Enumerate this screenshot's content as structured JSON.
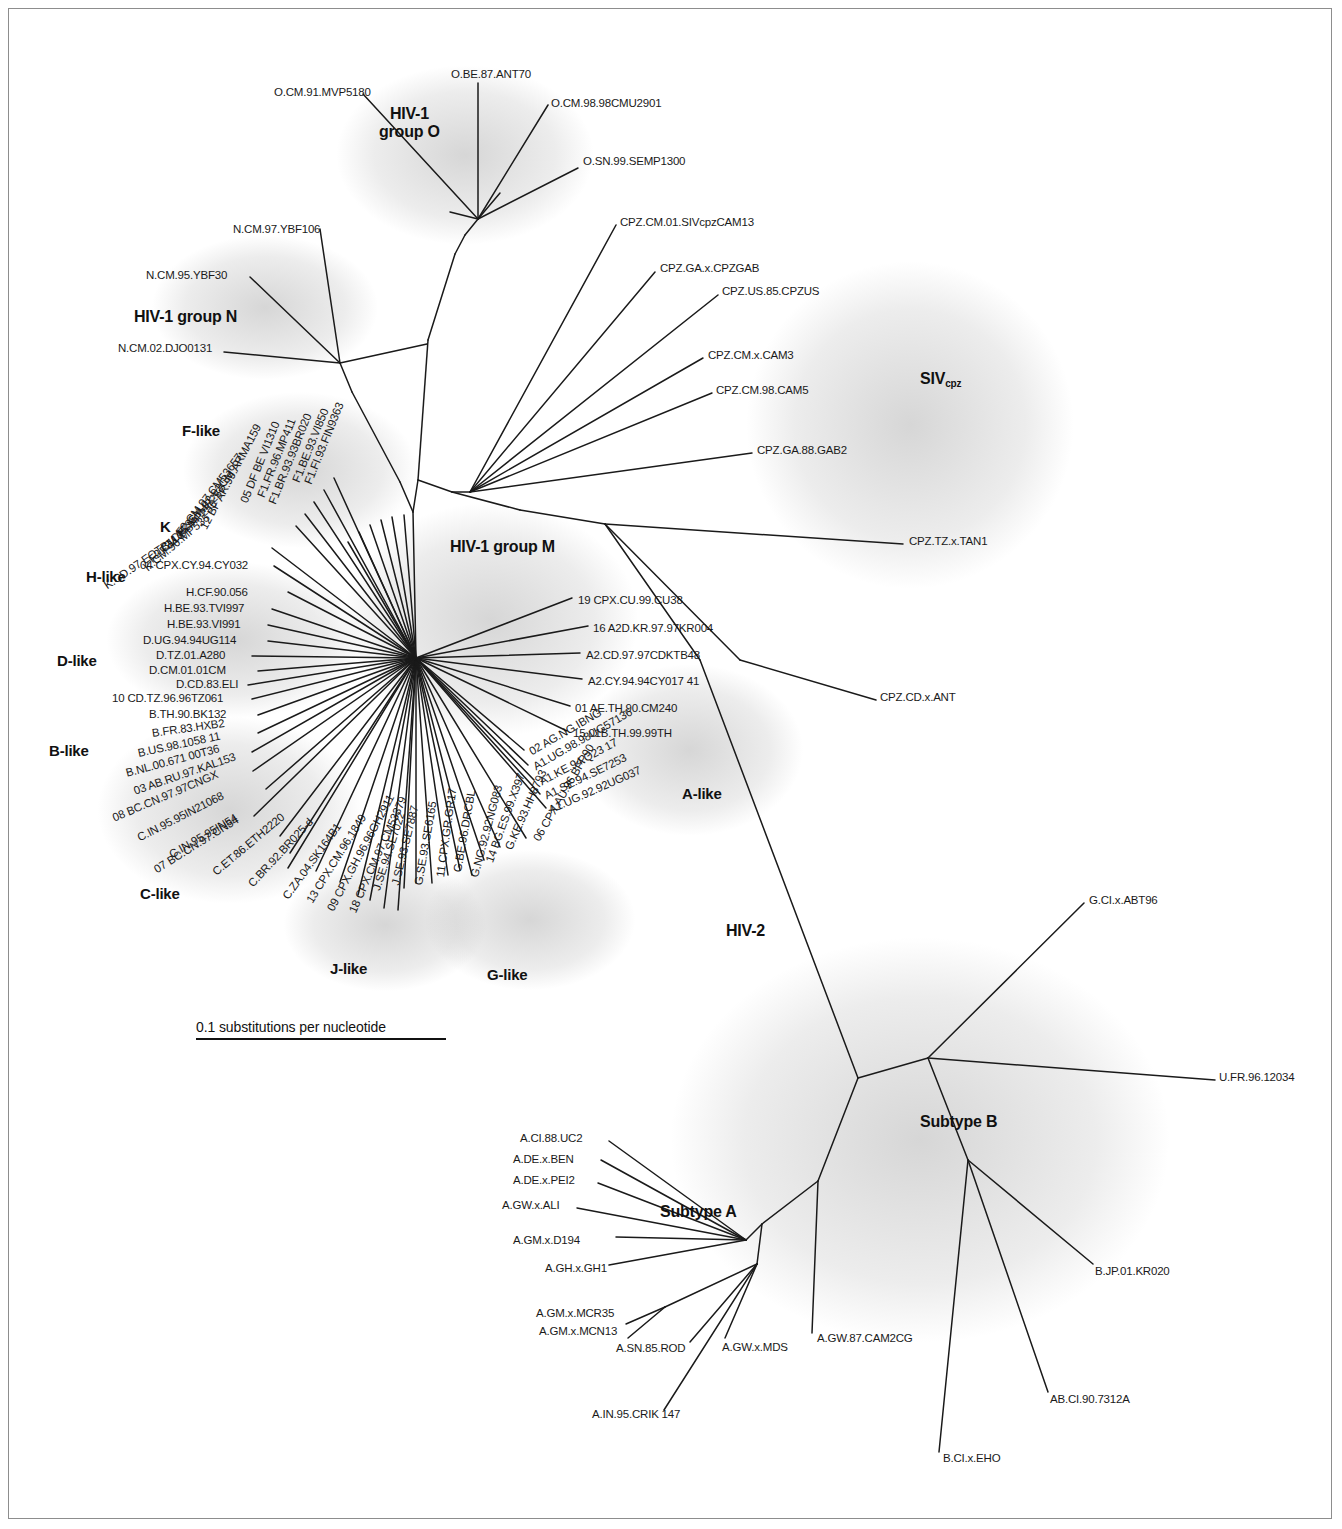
{
  "figure": {
    "type": "unrooted-phylogenetic-tree",
    "scale_label": "0.1 substitutions per nucleotide"
  },
  "groups": [
    {
      "id": "hiv1-group-o",
      "label": "HIV-1\ngroup O",
      "x": 379,
      "y": 105,
      "size": 16
    },
    {
      "id": "hiv1-group-n",
      "label": "HIV-1 group N",
      "x": 134,
      "y": 308,
      "size": 16
    },
    {
      "id": "hiv1-group-m",
      "label": "HIV-1 group M",
      "x": 450,
      "y": 538,
      "size": 16
    },
    {
      "id": "siv-cpz",
      "label": "SIV",
      "sub": "cpz",
      "x": 920,
      "y": 370,
      "size": 16
    },
    {
      "id": "f-like",
      "label": "F-like",
      "x": 182,
      "y": 422,
      "size": 15
    },
    {
      "id": "k-cluster",
      "label": "K",
      "x": 160,
      "y": 518,
      "size": 15
    },
    {
      "id": "h-like",
      "label": "H-like",
      "x": 86,
      "y": 568,
      "size": 15
    },
    {
      "id": "d-like",
      "label": "D-like",
      "x": 57,
      "y": 652,
      "size": 15
    },
    {
      "id": "b-like",
      "label": "B-like",
      "x": 49,
      "y": 742,
      "size": 15
    },
    {
      "id": "c-like",
      "label": "C-like",
      "x": 140,
      "y": 885,
      "size": 15
    },
    {
      "id": "j-like",
      "label": "J-like",
      "x": 330,
      "y": 960,
      "size": 15
    },
    {
      "id": "g-like",
      "label": "G-like",
      "x": 487,
      "y": 966,
      "size": 15
    },
    {
      "id": "a-like",
      "label": "A-like",
      "x": 682,
      "y": 785,
      "size": 15
    },
    {
      "id": "hiv-2",
      "label": "HIV-2",
      "x": 726,
      "y": 922,
      "size": 16
    },
    {
      "id": "subtype-a",
      "label": "Subtype A",
      "x": 660,
      "y": 1203,
      "size": 16
    },
    {
      "id": "subtype-b",
      "label": "Subtype B",
      "x": 920,
      "y": 1113,
      "size": 16
    }
  ],
  "taxa": [
    {
      "name": "O.CM.91.MVP5180",
      "x": 274,
      "y": 92,
      "rot": 0,
      "anchor": "start"
    },
    {
      "name": "O.BE.87.ANT70",
      "x": 451,
      "y": 74,
      "rot": 0,
      "anchor": "start"
    },
    {
      "name": "O.CM.98.98CMU2901",
      "x": 551,
      "y": 103,
      "rot": 0,
      "anchor": "start"
    },
    {
      "name": "O.SN.99.SEMP1300",
      "x": 583,
      "y": 161,
      "rot": 0,
      "anchor": "start"
    },
    {
      "name": "N.CM.97.YBF106",
      "x": 233,
      "y": 229,
      "rot": 0,
      "anchor": "start"
    },
    {
      "name": "N.CM.95.YBF30",
      "x": 146,
      "y": 275,
      "rot": 0,
      "anchor": "start"
    },
    {
      "name": "N.CM.02.DJO0131",
      "x": 118,
      "y": 348,
      "rot": 0,
      "anchor": "start"
    },
    {
      "name": "CPZ.CM.01.SIVcpzCAM13",
      "x": 620,
      "y": 222,
      "rot": 0,
      "anchor": "start"
    },
    {
      "name": "CPZ.GA.x.CPZGAB",
      "x": 660,
      "y": 268,
      "rot": 0,
      "anchor": "start"
    },
    {
      "name": "CPZ.US.85.CPZUS",
      "x": 722,
      "y": 291,
      "rot": 0,
      "anchor": "start"
    },
    {
      "name": "CPZ.CM.x.CAM3",
      "x": 708,
      "y": 355,
      "rot": 0,
      "anchor": "start"
    },
    {
      "name": "CPZ.CM.98.CAM5",
      "x": 716,
      "y": 390,
      "rot": 0,
      "anchor": "start"
    },
    {
      "name": "CPZ.GA.88.GAB2",
      "x": 757,
      "y": 450,
      "rot": 0,
      "anchor": "start"
    },
    {
      "name": "CPZ.TZ.x.TAN1",
      "x": 909,
      "y": 541,
      "rot": 0,
      "anchor": "start"
    },
    {
      "name": "CPZ.CD.x.ANT",
      "x": 880,
      "y": 697,
      "rot": 0,
      "anchor": "start"
    },
    {
      "name": "F1.FI.93.FIN9363",
      "x": 340,
      "y": 403,
      "rot": 68,
      "anchor": "end"
    },
    {
      "name": "F1.BE.93.VI850",
      "x": 325,
      "y": 409,
      "rot": 68,
      "anchor": "end"
    },
    {
      "name": "F1.BR.93.93BR020",
      "x": 308,
      "y": 414,
      "rot": 68,
      "anchor": "end"
    },
    {
      "name": "F1.FR.96.MP411",
      "x": 292,
      "y": 419,
      "rot": 68,
      "anchor": "end"
    },
    {
      "name": "05 DF BE VI1310",
      "x": 276,
      "y": 422,
      "rot": 68,
      "anchor": "end"
    },
    {
      "name": "12 BF AR.99.ARMA159",
      "x": 258,
      "y": 425,
      "rot": 62,
      "anchor": "end"
    },
    {
      "name": "F2.CM.97.CM53657",
      "x": 240,
      "y": 455,
      "rot": 52,
      "anchor": "end"
    },
    {
      "name": "F2.CM.02.02CM",
      "x": 232,
      "y": 472,
      "rot": 50,
      "anchor": "end"
    },
    {
      "name": "F2.CM.95.IMP257",
      "x": 224,
      "y": 487,
      "rot": 46,
      "anchor": "end"
    },
    {
      "name": "F2.CM.95.MP255",
      "x": 215,
      "y": 502,
      "rot": 42,
      "anchor": "end"
    },
    {
      "name": "K.CM.96.MP535",
      "x": 208,
      "y": 516,
      "rot": 40,
      "anchor": "end"
    },
    {
      "name": "K.CD.97.EQTB11C",
      "x": 184,
      "y": 533,
      "rot": 34,
      "anchor": "end"
    },
    {
      "name": "04 CPX.CY.94.CY032",
      "x": 140,
      "y": 565,
      "rot": 0,
      "anchor": "start"
    },
    {
      "name": "H.CF.90.056",
      "x": 186,
      "y": 592,
      "rot": 0,
      "anchor": "start"
    },
    {
      "name": "H.BE.93.TVI997",
      "x": 164,
      "y": 608,
      "rot": 0,
      "anchor": "start"
    },
    {
      "name": "H.BE.93.VI991",
      "x": 167,
      "y": 624,
      "rot": 0,
      "anchor": "start"
    },
    {
      "name": "D.UG.94.94UG114",
      "x": 143,
      "y": 640,
      "rot": 0,
      "anchor": "start"
    },
    {
      "name": "D.TZ.01.A280",
      "x": 156,
      "y": 655,
      "rot": 0,
      "anchor": "start"
    },
    {
      "name": "D.CM.01.01CM",
      "x": 149,
      "y": 670,
      "rot": 0,
      "anchor": "start"
    },
    {
      "name": "D.CD.83.ELI",
      "x": 176,
      "y": 684,
      "rot": 0,
      "anchor": "start"
    },
    {
      "name": "10 CD.TZ.96.96TZ061",
      "x": 112,
      "y": 698,
      "rot": 0,
      "anchor": "start"
    },
    {
      "name": "B.TH.90.BK132",
      "x": 149,
      "y": 714,
      "rot": 0,
      "anchor": "start"
    },
    {
      "name": "B.FR.83.HXB2",
      "x": 152,
      "y": 733,
      "rot": 8,
      "anchor": "start"
    },
    {
      "name": "B.US.98.1058 11",
      "x": 138,
      "y": 753,
      "rot": 12,
      "anchor": "start"
    },
    {
      "name": "B.NL.00.671 00T36",
      "x": 126,
      "y": 773,
      "rot": 15,
      "anchor": "start"
    },
    {
      "name": "03 AB.RU.97.KAL153",
      "x": 134,
      "y": 791,
      "rot": 19,
      "anchor": "start"
    },
    {
      "name": "08 BC.CN.97.97CNGX",
      "x": 113,
      "y": 818,
      "rot": 23,
      "anchor": "start"
    },
    {
      "name": "C.IN.95.95IN21068",
      "x": 138,
      "y": 838,
      "rot": 27,
      "anchor": "start"
    },
    {
      "name": "C.IN.95.95IN54",
      "x": 170,
      "y": 855,
      "rot": 30,
      "anchor": "start"
    },
    {
      "name": "07 BC.CN.97.CN54",
      "x": 155,
      "y": 870,
      "rot": 32,
      "anchor": "start"
    },
    {
      "name": "C.ET.86.ETH2220",
      "x": 214,
      "y": 873,
      "rot": 40,
      "anchor": "start"
    },
    {
      "name": "C.BR.92.BR025-d",
      "x": 250,
      "y": 885,
      "rot": 47,
      "anchor": "start"
    },
    {
      "name": "C.ZA.04.SK164B1",
      "x": 285,
      "y": 898,
      "rot": 54,
      "anchor": "start"
    },
    {
      "name": "13 CPX.CM.96.1849",
      "x": 309,
      "y": 902,
      "rot": 58,
      "anchor": "start"
    },
    {
      "name": "09 CPX.GH.96.96GH2911",
      "x": 330,
      "y": 910,
      "rot": 62,
      "anchor": "start"
    },
    {
      "name": "18 CPX.CM.97.CM53379",
      "x": 352,
      "y": 912,
      "rot": 66,
      "anchor": "start"
    },
    {
      "name": "J.SE.94.SE7022",
      "x": 376,
      "y": 890,
      "rot": 72,
      "anchor": "start"
    },
    {
      "name": "J.SE.93.SE7887",
      "x": 395,
      "y": 885,
      "rot": 76,
      "anchor": "start"
    },
    {
      "name": "G.SE.93.SE6165",
      "x": 418,
      "y": 885,
      "rot": 80,
      "anchor": "start"
    },
    {
      "name": "11 CPX.GR.GR17",
      "x": 440,
      "y": 877,
      "rot": 82,
      "anchor": "start"
    },
    {
      "name": "G.BE.96.DRCBL",
      "x": 457,
      "y": 872,
      "rot": 80,
      "anchor": "start"
    },
    {
      "name": "G.NG.92.92NG083",
      "x": 474,
      "y": 877,
      "rot": 75,
      "anchor": "start"
    },
    {
      "name": "14 BG.ES.99.X397",
      "x": 489,
      "y": 862,
      "rot": 70,
      "anchor": "start"
    },
    {
      "name": "G.KE.93.HH8793",
      "x": 508,
      "y": 849,
      "rot": 66,
      "anchor": "start"
    },
    {
      "name": "06 CPX.AU.96.BFP90",
      "x": 536,
      "y": 840,
      "rot": 60,
      "anchor": "start"
    },
    {
      "name": "02 AG.NG.IBNG",
      "x": 530,
      "y": 752,
      "rot": 30,
      "anchor": "start"
    },
    {
      "name": "A1.UG.98.98UG57136",
      "x": 534,
      "y": 767,
      "rot": 30,
      "anchor": "start"
    },
    {
      "name": "A1.KE.94.Q23 17",
      "x": 540,
      "y": 782,
      "rot": 28,
      "anchor": "start"
    },
    {
      "name": "A1.SE.94.SE7253",
      "x": 545,
      "y": 796,
      "rot": 26,
      "anchor": "start"
    },
    {
      "name": "A1.UG.92.92UG037",
      "x": 549,
      "y": 810,
      "rot": 24,
      "anchor": "start"
    },
    {
      "name": "15 01B.TH.99.99TH",
      "x": 573,
      "y": 733,
      "rot": 0,
      "anchor": "start"
    },
    {
      "name": "01 AE.TH.90.CM240",
      "x": 575,
      "y": 708,
      "rot": 0,
      "anchor": "start"
    },
    {
      "name": "A2.CY.94.94CY017 41",
      "x": 588,
      "y": 681,
      "rot": 0,
      "anchor": "start"
    },
    {
      "name": "A2.CD.97.97CDKTB48",
      "x": 586,
      "y": 655,
      "rot": 0,
      "anchor": "start"
    },
    {
      "name": "16 A2D.KR.97.97KR004",
      "x": 593,
      "y": 628,
      "rot": 0,
      "anchor": "start"
    },
    {
      "name": "19 CPX.CU.99.CU38",
      "x": 578,
      "y": 600,
      "rot": 0,
      "anchor": "start"
    },
    {
      "name": "G.CI.x.ABT96",
      "x": 1089,
      "y": 900,
      "rot": 0,
      "anchor": "start"
    },
    {
      "name": "U.FR.96.12034",
      "x": 1219,
      "y": 1077,
      "rot": 0,
      "anchor": "start"
    },
    {
      "name": "B.JP.01.KR020",
      "x": 1095,
      "y": 1271,
      "rot": 0,
      "anchor": "start"
    },
    {
      "name": "AB.CI.90.7312A",
      "x": 1050,
      "y": 1399,
      "rot": 0,
      "anchor": "start"
    },
    {
      "name": "B.CI.x.EHO",
      "x": 943,
      "y": 1458,
      "rot": 0,
      "anchor": "start"
    },
    {
      "name": "A.GW.87.CAM2CG",
      "x": 817,
      "y": 1338,
      "rot": 0,
      "anchor": "start"
    },
    {
      "name": "A.GW.x.MDS",
      "x": 722,
      "y": 1347,
      "rot": 0,
      "anchor": "start"
    },
    {
      "name": "A.SN.85.ROD",
      "x": 616,
      "y": 1348,
      "rot": 0,
      "anchor": "start"
    },
    {
      "name": "A.IN.95.CRIK 147",
      "x": 592,
      "y": 1414,
      "rot": 0,
      "anchor": "start"
    },
    {
      "name": "A.GM.x.MCN13",
      "x": 539,
      "y": 1331,
      "rot": 0,
      "anchor": "start"
    },
    {
      "name": "A.GM.x.MCR35",
      "x": 536,
      "y": 1313,
      "rot": 0,
      "anchor": "start"
    },
    {
      "name": "A.GH.x.GH1",
      "x": 545,
      "y": 1268,
      "rot": 0,
      "anchor": "start"
    },
    {
      "name": "A.GM.x.D194",
      "x": 513,
      "y": 1240,
      "rot": 0,
      "anchor": "start"
    },
    {
      "name": "A.GW.x.ALI",
      "x": 502,
      "y": 1205,
      "rot": 0,
      "anchor": "start"
    },
    {
      "name": "A.DE.x.PEI2",
      "x": 513,
      "y": 1180,
      "rot": 0,
      "anchor": "start"
    },
    {
      "name": "A.DE.x.BEN",
      "x": 513,
      "y": 1159,
      "rot": 0,
      "anchor": "start"
    },
    {
      "name": "A.CI.88.UC2",
      "x": 520,
      "y": 1138,
      "rot": 0,
      "anchor": "start"
    }
  ],
  "scale": {
    "x": 196,
    "y": 1019,
    "width": 250,
    "label": "0.1 substitutions per nucleotide"
  },
  "colors": {
    "line": "#1a1a1a",
    "text": "#1a1a1a",
    "shade": "#8a8a8a",
    "frame": "#8d8d8d",
    "background": "#ffffff"
  }
}
